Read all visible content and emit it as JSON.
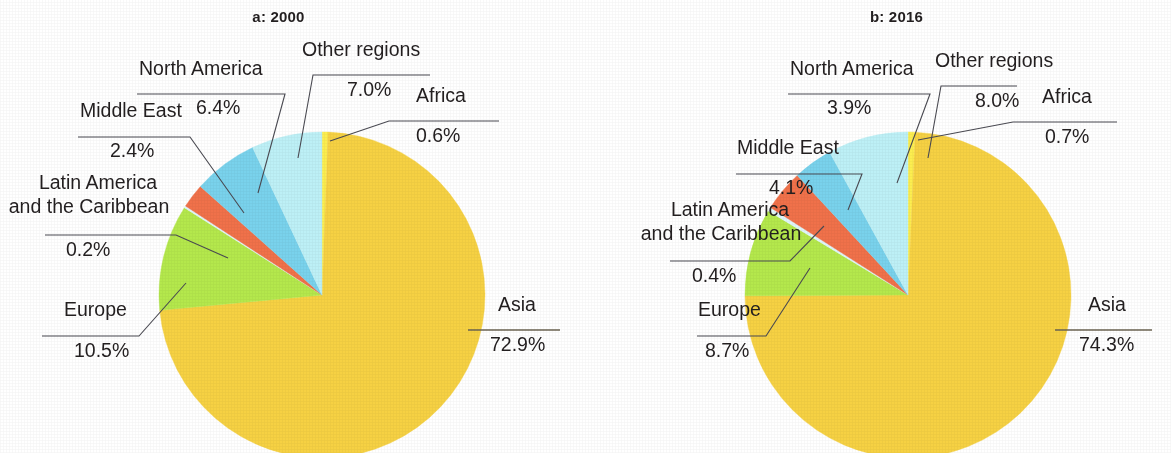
{
  "figure": {
    "panels": [
      {
        "id": "a",
        "title": "a: 2000",
        "center": [
          322,
          295
        ],
        "radius": 163,
        "labels": {
          "north_america": "North America",
          "north_america_pct": "6.4%",
          "middle_east": "Middle East",
          "middle_east_pct": "2.4%",
          "latin_america_line1": "Latin America",
          "latin_america_line2": "and the Caribbean",
          "latin_america_pct": "0.2%",
          "europe": "Europe",
          "europe_pct": "10.5%",
          "asia": "Asia",
          "asia_pct": "72.9%",
          "africa": "Africa",
          "africa_pct": "0.6%",
          "other_regions": "Other regions",
          "other_regions_pct": "7.0%"
        }
      },
      {
        "id": "b",
        "title": "b: 2016",
        "center": [
          908,
          295
        ],
        "radius": 163,
        "labels": {
          "north_america": "North America",
          "north_america_pct": "3.9%",
          "middle_east": "Middle East",
          "middle_east_pct": "4.1%",
          "latin_america_line1": "Latin America",
          "latin_america_line2": "and the Caribbean",
          "latin_america_pct": "0.4%",
          "europe": "Europe",
          "europe_pct": "8.7%",
          "asia": "Asia",
          "asia_pct": "74.3%",
          "africa": "Africa",
          "africa_pct": "0.7%",
          "other_regions": "Other regions",
          "other_regions_pct": "8.0%"
        }
      }
    ]
  },
  "colors": {
    "asia": "#F6D143",
    "africa": "#FCEE4F",
    "europe": "#B4E84C",
    "latin_america": "#E0F6FB",
    "middle_east": "#F0714A",
    "north_america": "#79D2EC",
    "other_regions": "#BDF0F6",
    "leader": "#4a4a52",
    "text": "#231f20"
  },
  "chart_data": [
    {
      "type": "pie",
      "title": "a: 2000",
      "categories": [
        "Africa",
        "Asia",
        "Europe",
        "Latin America and the Caribbean",
        "Middle East",
        "North America",
        "Other regions"
      ],
      "values": [
        0.6,
        72.9,
        10.5,
        0.2,
        2.4,
        6.4,
        7.0
      ],
      "value_labels": [
        "0.6%",
        "72.9%",
        "10.5%",
        "0.2%",
        "2.4%",
        "6.4%",
        "7.0%"
      ],
      "colors": [
        "#FCEE4F",
        "#F6D143",
        "#B4E84C",
        "#E0F6FB",
        "#F0714A",
        "#79D2EC",
        "#BDF0F6"
      ],
      "units": "percent",
      "start_angle_deg": 0,
      "direction": "clockwise",
      "legend": "none (direct labels with leader lines)"
    },
    {
      "type": "pie",
      "title": "b: 2016",
      "categories": [
        "Africa",
        "Asia",
        "Europe",
        "Latin America and the Caribbean",
        "Middle East",
        "North America",
        "Other regions"
      ],
      "values": [
        0.7,
        74.3,
        8.7,
        0.4,
        4.1,
        3.9,
        8.0
      ],
      "value_labels": [
        "0.7%",
        "74.3%",
        "8.7%",
        "0.4%",
        "4.1%",
        "3.9%",
        "8.0%"
      ],
      "colors": [
        "#FCEE4F",
        "#F6D143",
        "#B4E84C",
        "#E0F6FB",
        "#F0714A",
        "#79D2EC",
        "#BDF0F6"
      ],
      "units": "percent",
      "start_angle_deg": 0,
      "direction": "clockwise",
      "legend": "none (direct labels with leader lines)"
    }
  ]
}
